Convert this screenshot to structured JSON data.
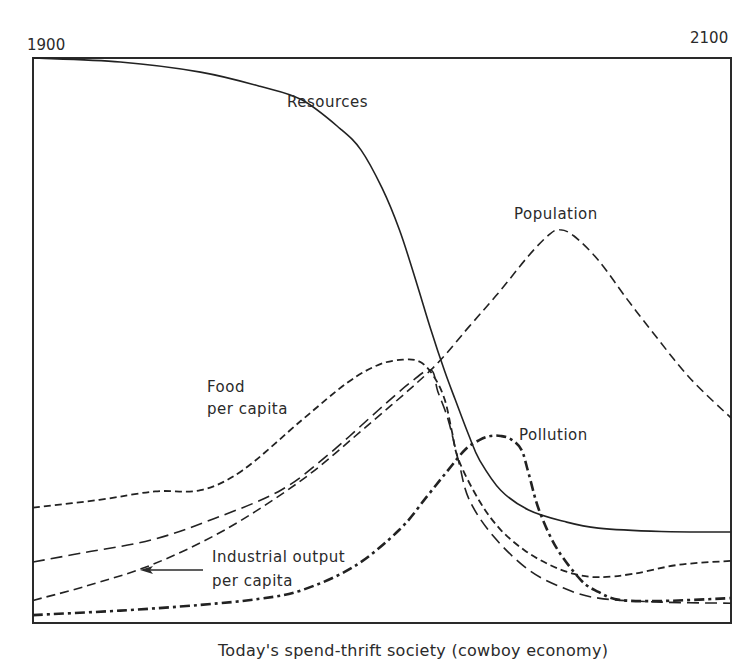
{
  "chart_data": {
    "type": "line",
    "title": "",
    "caption": "Today's spend-thrift society (cowboy economy)",
    "xlabel": "",
    "ylabel": "",
    "xlim": [
      1900,
      2100
    ],
    "ylim": [
      0,
      100
    ],
    "x_tick_labels": {
      "start": "1900",
      "end": "2100"
    },
    "grid": false,
    "series": [
      {
        "name": "Resources",
        "label": "Resources",
        "style": "solid",
        "points": [
          [
            1900,
            100
          ],
          [
            1925,
            99.3
          ],
          [
            1948,
            97.5
          ],
          [
            1965,
            95
          ],
          [
            1977,
            92.6
          ],
          [
            1988,
            87.5
          ],
          [
            1994,
            83.7
          ],
          [
            2000,
            77
          ],
          [
            2005,
            69.6
          ],
          [
            2010,
            60
          ],
          [
            2014,
            51.9
          ],
          [
            2018,
            44.5
          ],
          [
            2021,
            39.5
          ],
          [
            2025,
            33
          ],
          [
            2028,
            28.8
          ],
          [
            2034,
            23.5
          ],
          [
            2042,
            20
          ],
          [
            2052,
            18
          ],
          [
            2062,
            16.8
          ],
          [
            2080,
            16.2
          ],
          [
            2100,
            16.1
          ]
        ]
      },
      {
        "name": "Population",
        "label": "Population",
        "style": "dashed",
        "points": [
          [
            1900,
            4
          ],
          [
            1915,
            6.5
          ],
          [
            1934,
            10.3
          ],
          [
            1955,
            16.5
          ],
          [
            1977,
            25.3
          ],
          [
            1995,
            34.5
          ],
          [
            2014,
            44.8
          ],
          [
            2025,
            52.5
          ],
          [
            2034,
            58.9
          ],
          [
            2042,
            65
          ],
          [
            2048,
            68.8
          ],
          [
            2051,
            69.6
          ],
          [
            2055,
            68.5
          ],
          [
            2062,
            64.2
          ],
          [
            2070,
            57.5
          ],
          [
            2077,
            51.9
          ],
          [
            2088,
            43.5
          ],
          [
            2100,
            36.3
          ]
        ]
      },
      {
        "name": "Food per capita",
        "label": "Food\nper capita",
        "style": "short-dash",
        "points": [
          [
            1900,
            20.4
          ],
          [
            1919,
            21.8
          ],
          [
            1935,
            23.3
          ],
          [
            1948,
            23.5
          ],
          [
            1960,
            27
          ],
          [
            1977,
            35.9
          ],
          [
            1990,
            42.5
          ],
          [
            1999,
            45.7
          ],
          [
            2006,
            46.6
          ],
          [
            2011,
            46.2
          ],
          [
            2015,
            43.5
          ],
          [
            2018,
            39.5
          ],
          [
            2020,
            34
          ],
          [
            2022,
            28.8
          ],
          [
            2028,
            21.5
          ],
          [
            2034,
            16.5
          ],
          [
            2041,
            12.8
          ],
          [
            2048,
            10.3
          ],
          [
            2055,
            8.7
          ],
          [
            2062,
            8.1
          ],
          [
            2072,
            8.7
          ],
          [
            2085,
            10.3
          ],
          [
            2100,
            11
          ]
        ]
      },
      {
        "name": "Industrial output per capita",
        "label": "Industrial output\nper capita",
        "style": "long-dash",
        "points": [
          [
            1900,
            10.8
          ],
          [
            1915,
            12.5
          ],
          [
            1934,
            14.7
          ],
          [
            1952,
            18.5
          ],
          [
            1971,
            23.5
          ],
          [
            1985,
            30
          ],
          [
            1999,
            37.7
          ],
          [
            2008,
            42.5
          ],
          [
            2014,
            44.8
          ],
          [
            2016,
            41
          ],
          [
            2019,
            35.9
          ],
          [
            2022,
            28.5
          ],
          [
            2025,
            21.8
          ],
          [
            2032,
            15.3
          ],
          [
            2042,
            9.4
          ],
          [
            2052,
            6.2
          ],
          [
            2062,
            4.4
          ],
          [
            2080,
            3.7
          ],
          [
            2100,
            3.5
          ]
        ]
      },
      {
        "name": "Pollution",
        "label": "Pollution",
        "style": "heavy-dash",
        "points": [
          [
            1900,
            1.4
          ],
          [
            1925,
            2.2
          ],
          [
            1948,
            3.2
          ],
          [
            1965,
            4.3
          ],
          [
            1977,
            5.8
          ],
          [
            1992,
            10
          ],
          [
            2005,
            16.5
          ],
          [
            2013,
            22.5
          ],
          [
            2019,
            27.1
          ],
          [
            2024,
            30.8
          ],
          [
            2028,
            32.4
          ],
          [
            2031,
            33.1
          ],
          [
            2034,
            33.1
          ],
          [
            2037,
            32.5
          ],
          [
            2040,
            30.6
          ],
          [
            2042,
            26.5
          ],
          [
            2045,
            20
          ],
          [
            2050,
            13.3
          ],
          [
            2057,
            7.6
          ],
          [
            2062,
            5.5
          ],
          [
            2068,
            4.1
          ],
          [
            2080,
            3.9
          ],
          [
            2100,
            4.4
          ]
        ]
      }
    ],
    "annotations": [
      {
        "text": "Industrial output per capita",
        "arrow_to_series": "Industrial output per capita"
      }
    ]
  }
}
